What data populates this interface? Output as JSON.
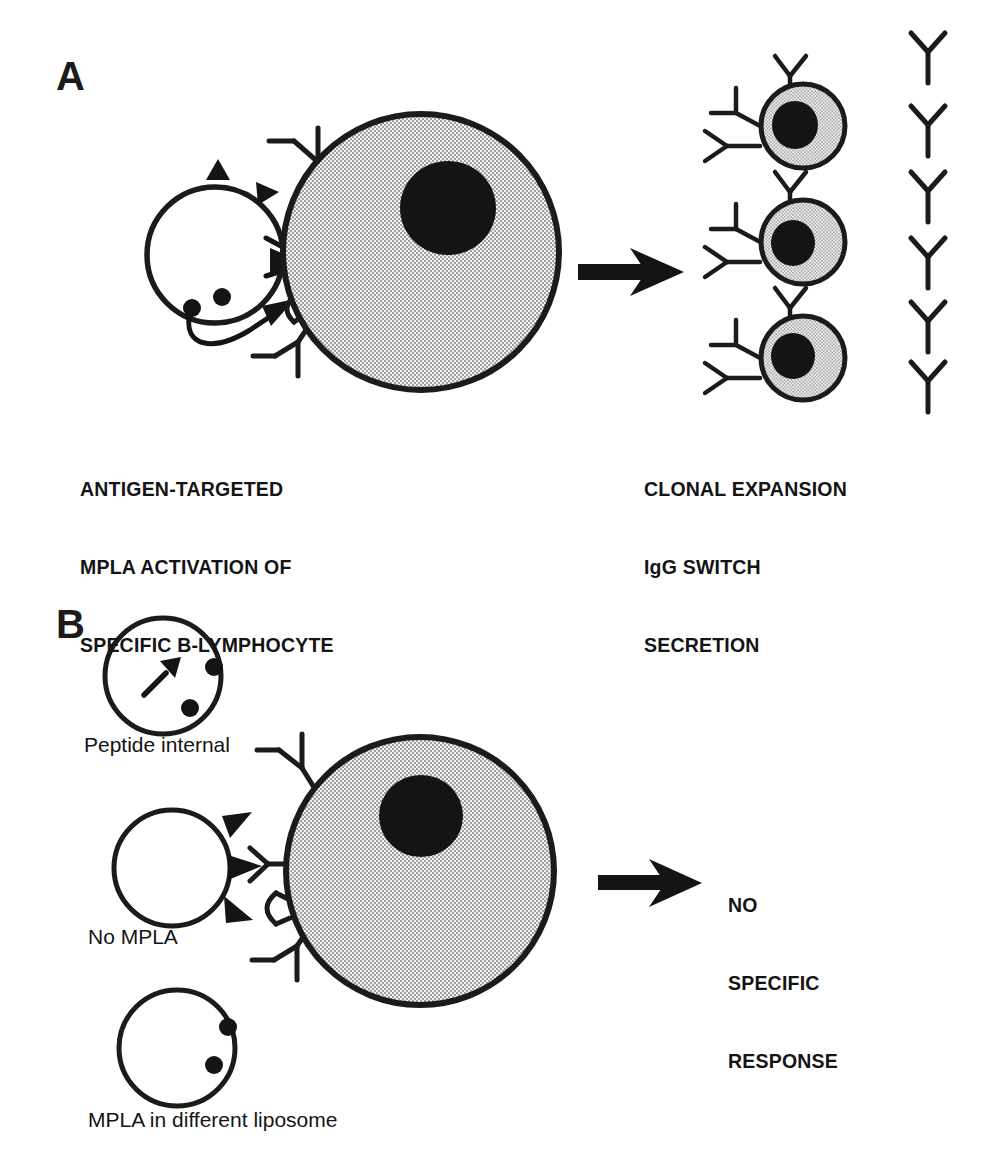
{
  "figure": {
    "width": 1004,
    "height": 1168,
    "background_color": "#ffffff",
    "ink_color": "#141414"
  },
  "colors": {
    "ink": "#141414",
    "outline": "#1b1b1b",
    "cytoplasm_stipple_light": "#e8e8e8",
    "cytoplasm_stipple_dark": "#8f8f8f",
    "nucleus": "#141414",
    "liposome_fill": "#ffffff"
  },
  "panels": [
    {
      "id": "A",
      "letter": "A",
      "left_caption": {
        "lines": [
          "ANTIGEN-TARGETED",
          "MPLA ACTIVATION OF",
          "SPECIFIC B-LYMPHOCYTE"
        ]
      },
      "right_caption": {
        "lines": [
          "CLONAL EXPANSION",
          "IgG SWITCH",
          "SECRETION"
        ]
      },
      "liposome": {
        "name": "antigen-and-mpla-liposome",
        "antigen_marker_count": 3,
        "mpla_marker_count": 2,
        "antigen_marker_shape": "filled-triangle",
        "mpla_marker_shape": "filled-circle"
      },
      "b_cell": {
        "name": "specific-b-lymphocyte",
        "receptor_count": 3,
        "receptor_shape": "Y",
        "nucleus": true
      },
      "arrow": {
        "direction": "right"
      },
      "plasma_cells": {
        "count": 3,
        "receptor_count_each": 3
      },
      "secreted_antibodies": {
        "count": 6,
        "shape": "Y"
      }
    },
    {
      "id": "B",
      "letter": "B",
      "liposomes": [
        {
          "name": "peptide-internal-liposome",
          "label": "Peptide internal",
          "antigen_marker_count": 1,
          "antigen_marker_position": "internal",
          "mpla_marker_count": 2
        },
        {
          "name": "no-mpla-liposome",
          "label": "No MPLA",
          "antigen_marker_count": 3,
          "antigen_marker_position": "surface",
          "mpla_marker_count": 0
        },
        {
          "name": "mpla-different-liposome",
          "label": "MPLA in different liposome",
          "antigen_marker_count": 0,
          "mpla_marker_count": 2
        }
      ],
      "b_cell": {
        "name": "non-activated-b-lymphocyte",
        "receptor_count": 3,
        "receptor_shapes": [
          "Y",
          "C",
          "Y"
        ],
        "nucleus": true
      },
      "arrow": {
        "direction": "right"
      },
      "right_caption": {
        "lines": [
          "NO",
          "SPECIFIC",
          "RESPONSE"
        ]
      }
    }
  ]
}
